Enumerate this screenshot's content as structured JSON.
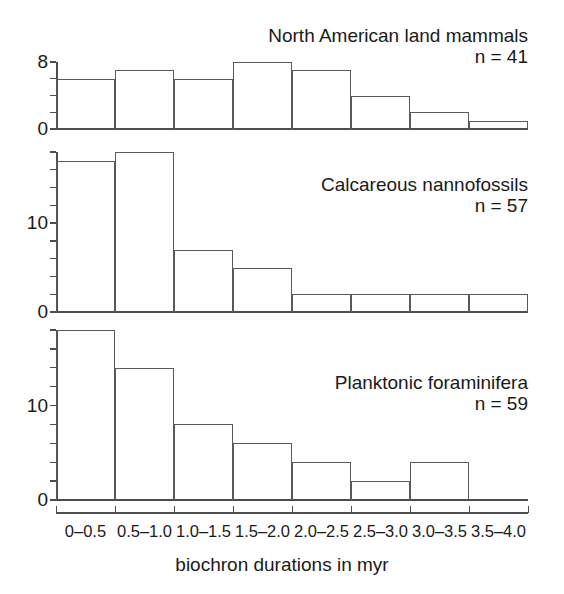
{
  "figure": {
    "background": "#ffffff",
    "line_color": "#5a5a5a",
    "axis_color": "#4d4d4d",
    "text_color": "#1a1a1a"
  },
  "axis": {
    "xlabel": "biochron durations in myr",
    "categories": [
      "0–0.5",
      "0.5–1.0",
      "1.0–1.5",
      "1.5–2.0",
      "2.0–2.5",
      "2.5–3.0",
      "3.0–3.5",
      "3.5–4.0"
    ]
  },
  "chart_data": [
    {
      "type": "bar",
      "title": "North American land mammals",
      "n_label": "n = 41",
      "n": 41,
      "xlabel": "biochron durations in myr",
      "ylabel": "",
      "categories": [
        "0–0.5",
        "0.5–1.0",
        "1.0–1.5",
        "1.5–2.0",
        "2.0–2.5",
        "2.5–3.0",
        "3.0–3.5",
        "3.5–4.0"
      ],
      "values": [
        6,
        7,
        6,
        8,
        7,
        4,
        2,
        1
      ],
      "ylim": [
        0,
        8
      ],
      "ytick_values": [
        0,
        2,
        4,
        6,
        8
      ],
      "ytick_labels_shown": [
        "0",
        "8"
      ],
      "ytick_label_positions": [
        0,
        8
      ],
      "grid": false,
      "legend": "none"
    },
    {
      "type": "bar",
      "title": "Calcareous nannofossils",
      "n_label": "n = 57",
      "n": 57,
      "xlabel": "biochron durations in myr",
      "ylabel": "",
      "categories": [
        "0–0.5",
        "0.5–1.0",
        "1.0–1.5",
        "1.5–2.0",
        "2.0–2.5",
        "2.5–3.0",
        "3.0–3.5",
        "3.5–4.0"
      ],
      "values": [
        17,
        18,
        7,
        5,
        2,
        2,
        2,
        2
      ],
      "ylim": [
        0,
        18
      ],
      "ytick_values": [
        0,
        2,
        4,
        6,
        8,
        10,
        12,
        14,
        16,
        18
      ],
      "ytick_labels_shown": [
        "0",
        "10"
      ],
      "ytick_label_positions": [
        0,
        10
      ],
      "grid": false,
      "legend": "none"
    },
    {
      "type": "bar",
      "title": "Planktonic foraminifera",
      "n_label": "n = 59",
      "n": 59,
      "xlabel": "biochron durations in myr",
      "ylabel": "",
      "categories": [
        "0–0.5",
        "0.5–1.0",
        "1.0–1.5",
        "1.5–2.0",
        "2.0–2.5",
        "2.5–3.0",
        "3.0–3.5",
        "3.5–4.0"
      ],
      "values": [
        18,
        14,
        8,
        6,
        4,
        2,
        4,
        0
      ],
      "ylim": [
        0,
        18
      ],
      "ytick_values": [
        0,
        2,
        4,
        6,
        8,
        10,
        12,
        14,
        16,
        18
      ],
      "ytick_labels_shown": [
        "0",
        "10"
      ],
      "ytick_label_positions": [
        0,
        10
      ],
      "grid": false,
      "legend": "none"
    }
  ]
}
